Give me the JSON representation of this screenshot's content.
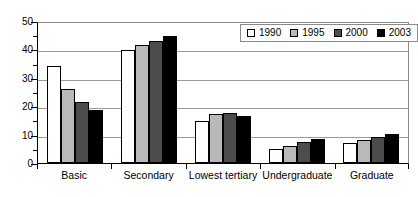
{
  "chart_data": {
    "type": "bar",
    "title": "",
    "subtitle": "",
    "xlabel": "",
    "ylabel": "",
    "ylim": [
      0,
      50
    ],
    "ytick_step": 10,
    "yminor_step": 5,
    "ytick_labels": [
      "0",
      "10",
      "20",
      "30",
      "40",
      "50"
    ],
    "grid": true,
    "legend_position": "top-right",
    "categories": [
      "Basic",
      "Secondary",
      "Lowest tertiary",
      "Undergraduate",
      "Graduate"
    ],
    "series": [
      {
        "name": "1990",
        "color": "#ffffff",
        "values": [
          34,
          39.8,
          14.8,
          5,
          7
        ]
      },
      {
        "name": "1995",
        "color": "#b9b9b9",
        "values": [
          26,
          41.5,
          17.3,
          6,
          8.2
        ]
      },
      {
        "name": "2000",
        "color": "#4c4c4c",
        "values": [
          21.5,
          43,
          17.6,
          7.3,
          9
        ]
      },
      {
        "name": "2003",
        "color": "#000000",
        "values": [
          18.5,
          44.8,
          16.5,
          8.5,
          10.2
        ]
      }
    ]
  },
  "colors": {
    "series_1990": "#ffffff",
    "series_1995": "#b9b9b9",
    "series_2000": "#4c4c4c",
    "series_2003": "#000000",
    "gridline": "#9a9a9a",
    "axis": "#000000",
    "plot_border": "#8a8a8a",
    "background": "#ffffff"
  }
}
